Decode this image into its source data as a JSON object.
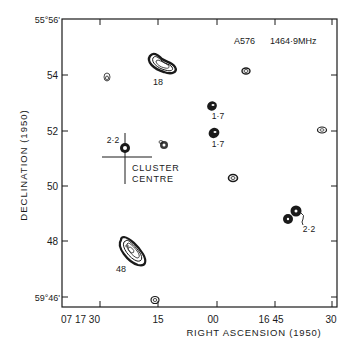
{
  "figure": {
    "title": "A576",
    "frequency": "1464·9MHz",
    "x_axis_label": "RIGHT ASCENSION (1950)",
    "y_axis_label": "DECLINATION (1950)",
    "y_ticks": [
      "55°56'",
      "54",
      "52",
      "50",
      "48",
      "59°46'"
    ],
    "x_ticks": [
      "07 17 30",
      "15",
      "00",
      "16 45",
      "30"
    ],
    "cluster_label_line1": "CLUSTER",
    "cluster_label_line2": "CENTRE"
  },
  "sources": [
    {
      "id": "s18",
      "label": "18"
    },
    {
      "id": "s48",
      "label": "48"
    },
    {
      "id": "s22a",
      "label": "2·2"
    },
    {
      "id": "s17a",
      "label": "1·7"
    },
    {
      "id": "s17b",
      "label": "1·7"
    },
    {
      "id": "s22b",
      "label": "2·2"
    }
  ],
  "colors": {
    "ink": "#1a1a1a",
    "background": "#ffffff"
  }
}
